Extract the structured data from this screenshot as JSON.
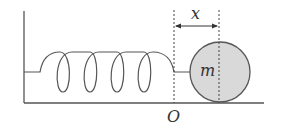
{
  "diagram": {
    "type": "spring-mass system",
    "labels": {
      "displacement": "x",
      "mass": "m",
      "origin": "O"
    },
    "colors": {
      "stroke": "#555555",
      "ball_fill": "#d9d9d9",
      "background": "#ffffff"
    },
    "spring_coils": 4
  }
}
